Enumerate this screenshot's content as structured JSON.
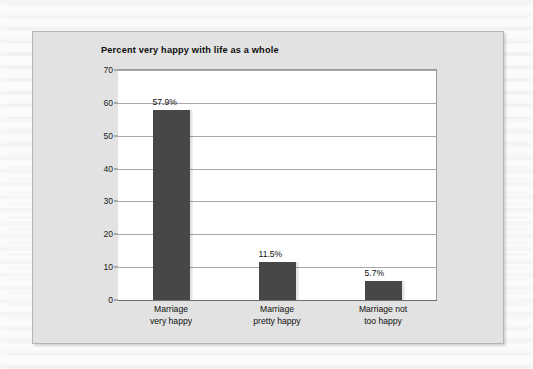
{
  "chart_data": {
    "type": "bar",
    "title": "Percent very happy with life as a whole",
    "categories": [
      "Marriage very happy",
      "Marriage pretty happy",
      "Marriage not too happy"
    ],
    "category_lines": [
      [
        "Marriage",
        "very happy"
      ],
      [
        "Marriage",
        "pretty happy"
      ],
      [
        "Marriage not",
        "too happy"
      ]
    ],
    "values": [
      57.9,
      11.5,
      5.7
    ],
    "value_labels": [
      "57.9%",
      "11.5%",
      "5.7%"
    ],
    "xlabel": "",
    "ylabel": "",
    "ylim": [
      0,
      70
    ],
    "yticks": [
      0,
      10,
      20,
      30,
      40,
      50,
      60,
      70
    ],
    "ytick_labels": [
      "0",
      "10",
      "20",
      "30",
      "40",
      "50",
      "60",
      "70"
    ],
    "grid": true,
    "legend": false,
    "bar_color": "#474747",
    "plot_background": "#ffffff",
    "panel_background": "#e2e2e2"
  }
}
